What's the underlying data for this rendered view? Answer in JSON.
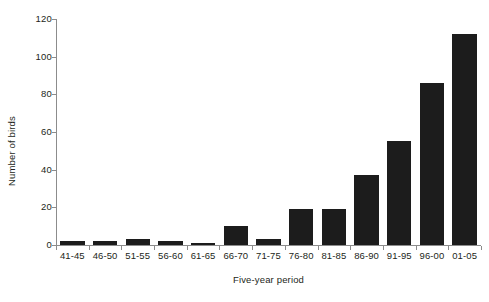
{
  "chart_data": {
    "type": "bar",
    "title": "",
    "subtitle": "",
    "xlabel": "Five-year period",
    "ylabel": "Number of birds",
    "categories": [
      "41-45",
      "46-50",
      "51-55",
      "56-60",
      "61-65",
      "66-70",
      "71-75",
      "76-80",
      "81-85",
      "86-90",
      "91-95",
      "96-00",
      "01-05"
    ],
    "values": [
      2,
      2,
      3,
      2,
      1,
      10,
      3,
      19,
      19,
      37,
      55,
      86,
      112
    ],
    "ylim": [
      0,
      120
    ],
    "ytick_labels": [
      "0",
      "20",
      "40",
      "60",
      "80",
      "100",
      "120"
    ],
    "ytick_values": [
      0,
      20,
      40,
      60,
      80,
      100,
      120
    ],
    "grid": false,
    "legend": false,
    "legend_position": "none",
    "bar_color": "#1c1c1c",
    "axis_color": "#8c8c8c",
    "background_color": "#ffffff",
    "text_color": "#231f20"
  }
}
